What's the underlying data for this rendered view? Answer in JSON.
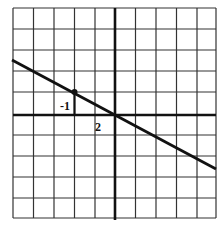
{
  "graph": {
    "grid": {
      "x_min": -5,
      "x_max": 5,
      "y_min": -5,
      "y_max": 5,
      "cols": 10,
      "rows": 10
    },
    "line": {
      "slope": -0.5,
      "intercept": 0,
      "description": "Line through origin with slope -1/2"
    },
    "point": {
      "x": -2,
      "y": 1
    },
    "slope_triangle": {
      "rise_label": "-1",
      "run_label": "2"
    },
    "colors": {
      "ink": "#111111",
      "grid": "#333333",
      "background": "#ffffff"
    }
  }
}
